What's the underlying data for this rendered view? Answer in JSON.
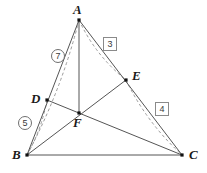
{
  "figure": {
    "type": "geometry-diagram",
    "background_color": "#ffffff",
    "solid_line_color": "#555555",
    "dashed_line_color": "#9a9a9a",
    "point_color": "#111111",
    "width": 207,
    "height": 173
  },
  "points": [
    {
      "id": "A",
      "label": "A",
      "x": 79,
      "y": 20,
      "label_x": 73,
      "label_y": 3,
      "marker": true
    },
    {
      "id": "B",
      "label": "B",
      "x": 27,
      "y": 155,
      "label_x": 12,
      "label_y": 148,
      "marker": true
    },
    {
      "id": "C",
      "label": "C",
      "x": 182,
      "y": 155,
      "label_x": 189,
      "label_y": 148,
      "marker": true
    },
    {
      "id": "D",
      "label": "D",
      "x": 47,
      "y": 100,
      "label_x": 31,
      "label_y": 92,
      "marker": true
    },
    {
      "id": "E",
      "label": "E",
      "x": 126,
      "y": 80,
      "label_x": 132,
      "label_y": 69,
      "marker": true
    },
    {
      "id": "F",
      "label": "F",
      "x": 79,
      "y": 113,
      "label_x": 73,
      "label_y": 116,
      "marker": true
    }
  ],
  "solid_edges": [
    {
      "name": "side-AB",
      "from": "A",
      "to": "B"
    },
    {
      "name": "side-BC",
      "from": "B",
      "to": "C"
    },
    {
      "name": "side-AC",
      "from": "A",
      "to": "C"
    },
    {
      "name": "cevian-AF",
      "from": "A",
      "to": "F"
    },
    {
      "name": "cevian-BE",
      "from": "B",
      "to": "E"
    },
    {
      "name": "cevian-DC",
      "from": "D",
      "to": "C"
    }
  ],
  "dashed_arcs": [
    {
      "name": "arc-AD-B",
      "from": "A",
      "to": "B",
      "bulge": -9
    },
    {
      "name": "arc-D-B",
      "from": "D",
      "to": "B",
      "bulge": -5
    },
    {
      "name": "arc-A-E",
      "from": "A",
      "to": "E",
      "bulge": 9
    },
    {
      "name": "arc-E-C",
      "from": "E",
      "to": "C",
      "bulge": 9
    }
  ],
  "annotations": {
    "circled": [
      {
        "name": "region-label-7",
        "text": "7",
        "x": 51,
        "y": 49
      },
      {
        "name": "region-label-5",
        "text": "5",
        "x": 18,
        "y": 116
      }
    ],
    "boxed": [
      {
        "name": "region-label-3",
        "text": "3",
        "x": 103,
        "y": 37
      },
      {
        "name": "region-label-4",
        "text": "4",
        "x": 155,
        "y": 102
      }
    ]
  }
}
